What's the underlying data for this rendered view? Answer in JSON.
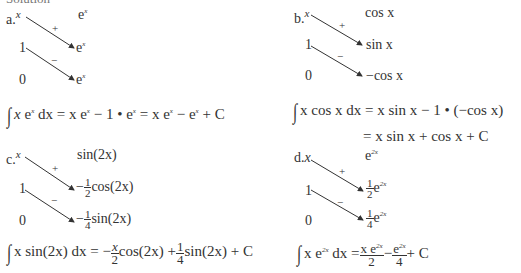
{
  "heading": "Solution",
  "parts": [
    {
      "label": "a.",
      "left_column": [
        "x",
        "1",
        "0"
      ],
      "signs": [
        "+",
        "−"
      ],
      "right_column": [
        "e^x",
        "e^x",
        "e^x"
      ],
      "result_lines": [
        "∫ x e^x dx = x e^x − 1 • e^x = x e^x − e^x + C"
      ]
    },
    {
      "label": "b.",
      "left_column": [
        "x",
        "1",
        "0"
      ],
      "signs": [
        "+",
        "−"
      ],
      "right_column": [
        "cos x",
        "sin x",
        "−cos x"
      ],
      "result_lines": [
        "∫ x cos x dx = x sin x − 1 • (−cos x)",
        "= x sin x + cos x + C"
      ]
    },
    {
      "label": "c.",
      "left_column": [
        "x",
        "1",
        "0"
      ],
      "signs": [
        "+",
        "−"
      ],
      "right_column": [
        "sin(2x)",
        "−(1/2)cos(2x)",
        "−(1/4)sin(2x)"
      ],
      "result_lines": [
        "∫ x sin(2x) dx = −(x/2)cos(2x) + (1/4)sin(2x) + C"
      ]
    },
    {
      "label": "d.",
      "left_column": [
        "x",
        "1",
        "0"
      ],
      "signs": [
        "+",
        "−"
      ],
      "right_column": [
        "e^{2x}",
        "(1/2)e^{2x}",
        "(1/4)e^{2x}"
      ],
      "result_lines": [
        "∫ x e^{2x} dx = x e^{2x}/2 − e^{2x}/4 + C"
      ]
    }
  ],
  "text": {
    "x": "x",
    "one": "1",
    "zero": "0",
    "plus": "+",
    "minus": "−",
    "e": "e",
    "sup_x": "x",
    "sup_2x": "2x",
    "cosx": "cos x",
    "sinx": "sin x",
    "negcosx": "−cos x",
    "sin2x": "sin(2x)",
    "cos2x": "cos(2x)",
    "half_num": "1",
    "half_den": "2",
    "quarter_num": "1",
    "quarter_den": "4",
    "neg": "−",
    "a_label": "a.",
    "b_label": "b.",
    "c_label": "c.",
    "d_label": "d.",
    "a_eq_mid": " = x e",
    "a_eq_mid2": " − 1 • e",
    "a_eq_mid3": " = x e",
    "a_eq_end": " − e",
    "a_eq_tail": " + C",
    "b_eq1": "x cos x dx = x sin x − 1 • (−cos x)",
    "b_eq2": "= x sin x + cos x + C",
    "c_eq_start": "x sin(2x) dx = −",
    "c_frac_num": "x",
    "c_frac_den": "2",
    "c_eq_mid": "cos(2x) +",
    "c_eq_end": "sin(2x) + C",
    "d_eq_start": "x e",
    "d_eq_dx": " dx =",
    "d_f1_num": "x e",
    "d_f1_den": "2",
    "d_f2_num": "e",
    "d_f2_den": "4",
    "d_eq_end": "+ C",
    "dx": " dx",
    "integral": "∫"
  }
}
